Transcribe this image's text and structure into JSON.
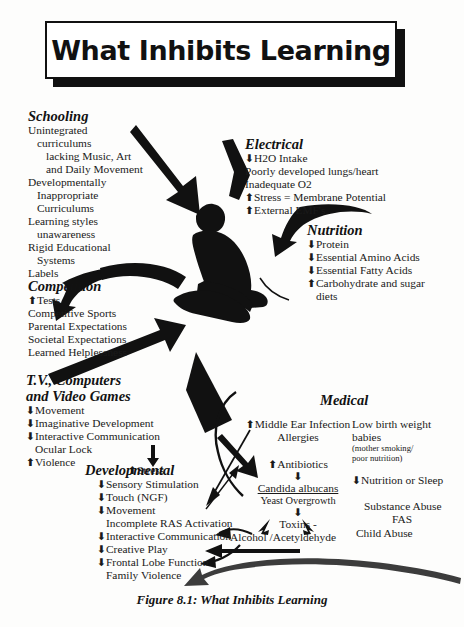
{
  "figure": {
    "banner_title": "What Inhibits Learning",
    "caption": "Figure 8.1:  What Inhibits Learning"
  },
  "colors": {
    "ink": "#111111",
    "paper": "#fdfdfc",
    "arrow": "#111111"
  },
  "nodes": {
    "schooling": {
      "heading": "Schooling",
      "items": [
        "Unintegrated",
        "curriculums",
        "lacking Music, Art",
        "and Daily Movement",
        "Developmentally",
        "Inappropriate",
        "Curriculums",
        "Learning styles",
        "unawareness",
        "Rigid Educational",
        "Systems",
        "Labels"
      ]
    },
    "electrical": {
      "heading": "Electrical",
      "items": [
        "H2O Intake",
        "Poorly developed lungs/heart",
        "Inadequate O2",
        "Stress = Membrane Potential",
        "External EMF's"
      ],
      "arrows": [
        "down",
        "none",
        "none",
        "up-down",
        "up"
      ]
    },
    "nutrition": {
      "heading": "Nutrition",
      "items": [
        "Protein",
        "Essential Amino Acids",
        "Essential Fatty Acids",
        "Carbohydrate and sugar",
        "diets"
      ],
      "arrows": [
        "down",
        "down",
        "down",
        "up",
        "none"
      ]
    },
    "competition": {
      "heading": "Competition",
      "items": [
        "Tests",
        "Competitive Sports",
        "Parental Expectations",
        "Societal Expectations",
        "Learned Helplessness"
      ],
      "arrows": [
        "up",
        "none",
        "none",
        "none",
        "none"
      ]
    },
    "tv_computers": {
      "heading_line1": "T.V., Computers",
      "heading_line2": "and Video Games",
      "items": [
        "Movement",
        "Imaginative Development",
        "Interactive Communication",
        "Ocular Lock",
        "Violence"
      ],
      "arrows": [
        "down",
        "down",
        "down",
        "none",
        "up"
      ],
      "stress_label": "Stress",
      "stress_arrow": "up"
    },
    "developmental": {
      "heading": "Developmental",
      "items": [
        "Sensory Stimulation",
        "Touch (NGF)",
        "Movement",
        "Incomplete RAS Activation",
        "Interactive Communication",
        "Creative Play",
        "Frontal Lobe Function",
        "Family Violence"
      ],
      "arrows": [
        "down",
        "down",
        "down",
        "none",
        "down",
        "down",
        "down",
        "none"
      ]
    },
    "medical": {
      "heading": "Medical",
      "chain": {
        "middle_ear": "Middle Ear Infection",
        "middle_ear_arrow": "up",
        "allergies": "Allergies",
        "antibiotics": "Antibiotics",
        "antibiotics_arrow": "up",
        "candida": "Candida albucans",
        "yeast": "Yeast Overgrowth",
        "toxins": "Toxins -",
        "alcohol": "Alcohol /Acetyldehyde"
      },
      "right_column": {
        "low_birth_weight_line1": "Low birth weight",
        "low_birth_weight_line2": "babies",
        "low_birth_note_line1": "(mother smoking/",
        "low_birth_note_line2": "poor nutrition)",
        "nutrition_sleep": "Nutrition or Sleep",
        "nutrition_sleep_arrow": "down",
        "substance_abuse": "Substance Abuse",
        "fas": "FAS",
        "child_abuse": "Child Abuse"
      }
    }
  }
}
